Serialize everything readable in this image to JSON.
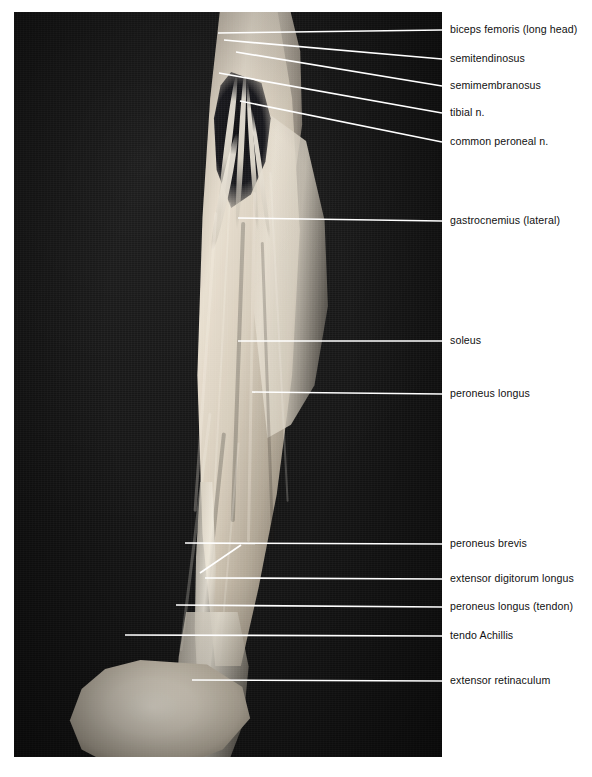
{
  "figure": {
    "kind": "anatomical-dissection-photograph",
    "region": "posterior and lateral aspect of right leg",
    "plate": {
      "x": 14,
      "y": 12,
      "width": 428,
      "height": 745,
      "background_color": "#141414"
    },
    "page": {
      "width": 592,
      "height": 777,
      "background_color": "#ffffff"
    },
    "leader_color": "#ffffff",
    "label_color": "#111111"
  },
  "labels": [
    {
      "id": "biceps-femoris-long-head",
      "text": "biceps femoris (long head)",
      "text_y": 30,
      "leader": {
        "x1": 218,
        "y1": 33,
        "x2": 442,
        "y2": 30
      }
    },
    {
      "id": "semitendinosus",
      "text": "semitendinosus",
      "text_y": 59,
      "leader": {
        "x1": 224,
        "y1": 40,
        "x2": 442,
        "y2": 59
      }
    },
    {
      "id": "semimembranosus",
      "text": "semimembranosus",
      "text_y": 86,
      "leader": {
        "x1": 236,
        "y1": 52,
        "x2": 442,
        "y2": 86
      }
    },
    {
      "id": "tibial-n",
      "text": "tibial n.",
      "text_y": 113,
      "leader": {
        "x1": 219,
        "y1": 73,
        "x2": 442,
        "y2": 113
      }
    },
    {
      "id": "common-peroneal-n",
      "text": "common peroneal n.",
      "text_y": 142,
      "leader": {
        "x1": 240,
        "y1": 101,
        "x2": 442,
        "y2": 142
      }
    },
    {
      "id": "gastrocnemius-lateral",
      "text": "gastrocnemius (lateral)",
      "text_y": 221,
      "leader": {
        "x1": 238,
        "y1": 218,
        "x2": 442,
        "y2": 221
      }
    },
    {
      "id": "soleus",
      "text": "soleus",
      "text_y": 341,
      "leader": {
        "x1": 238,
        "y1": 341,
        "x2": 442,
        "y2": 341
      }
    },
    {
      "id": "peroneus-longus",
      "text": "peroneus longus",
      "text_y": 394,
      "leader": {
        "x1": 252,
        "y1": 392,
        "x2": 442,
        "y2": 394
      }
    },
    {
      "id": "peroneus-brevis",
      "text": "peroneus brevis",
      "text_y": 544,
      "leader": {
        "x1": 185,
        "y1": 543,
        "x2": 442,
        "y2": 544
      },
      "branch": {
        "x1": 200,
        "y1": 573,
        "x2": 241,
        "y2": 545
      }
    },
    {
      "id": "extensor-digitorum-longus",
      "text": "extensor digitorum longus",
      "text_y": 579,
      "leader": {
        "x1": 205,
        "y1": 578,
        "x2": 442,
        "y2": 579
      }
    },
    {
      "id": "peroneus-longus-tendon",
      "text": "peroneus longus (tendon)",
      "text_y": 607,
      "leader": {
        "x1": 176,
        "y1": 605,
        "x2": 442,
        "y2": 607
      }
    },
    {
      "id": "tendo-achillis",
      "text": "tendo Achillis",
      "text_y": 636,
      "leader": {
        "x1": 125,
        "y1": 635,
        "x2": 442,
        "y2": 636
      }
    },
    {
      "id": "extensor-retinaculum",
      "text": "extensor retinaculum",
      "text_y": 681,
      "leader": {
        "x1": 192,
        "y1": 680,
        "x2": 442,
        "y2": 681
      }
    }
  ]
}
